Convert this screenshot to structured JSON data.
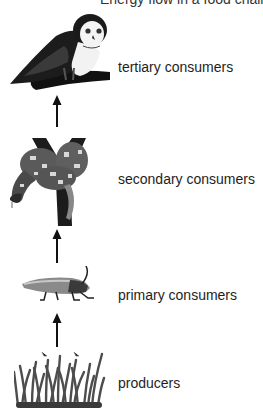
{
  "diagram": {
    "type": "food-chain",
    "title_partial": "Energy flow in a food chain",
    "levels": [
      {
        "id": "tertiary",
        "label": "tertiary consumers",
        "organism": "owl"
      },
      {
        "id": "secondary",
        "label": "secondary consumers",
        "organism": "snake"
      },
      {
        "id": "primary",
        "label": "primary consumers",
        "organism": "grasshopper"
      },
      {
        "id": "producers",
        "label": "producers",
        "organism": "grass"
      }
    ],
    "arrow_direction": "up"
  }
}
